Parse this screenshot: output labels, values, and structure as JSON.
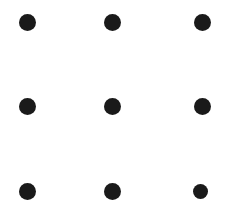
{
  "canvas": {
    "width": 240,
    "height": 213,
    "background_color": "#ffffff",
    "title": "Nine Dots Grid"
  },
  "dot_style": {
    "fill_color": "#1a1a1a",
    "shape": "circle"
  },
  "grid": {
    "rows": 3,
    "columns": 3,
    "count": 9,
    "column_centers_px": [
      27,
      112,
      202
    ],
    "row_centers_px": [
      22,
      106,
      191
    ]
  },
  "dots": [
    {
      "name": "dot-top-left",
      "row": 0,
      "col": 0,
      "cx": 27,
      "cy": 22,
      "d": 17
    },
    {
      "name": "dot-top-center",
      "row": 0,
      "col": 1,
      "cx": 112,
      "cy": 22,
      "d": 17
    },
    {
      "name": "dot-top-right",
      "row": 0,
      "col": 2,
      "cx": 202,
      "cy": 22,
      "d": 17
    },
    {
      "name": "dot-middle-left",
      "row": 1,
      "col": 0,
      "cx": 27,
      "cy": 106,
      "d": 17
    },
    {
      "name": "dot-middle-center",
      "row": 1,
      "col": 1,
      "cx": 112,
      "cy": 106,
      "d": 17
    },
    {
      "name": "dot-middle-right",
      "row": 1,
      "col": 2,
      "cx": 202,
      "cy": 106,
      "d": 17
    },
    {
      "name": "dot-bottom-left",
      "row": 2,
      "col": 0,
      "cx": 27,
      "cy": 191,
      "d": 17
    },
    {
      "name": "dot-bottom-center",
      "row": 2,
      "col": 1,
      "cx": 112,
      "cy": 191,
      "d": 17
    },
    {
      "name": "dot-bottom-right",
      "row": 2,
      "col": 2,
      "cx": 200,
      "cy": 191,
      "d": 15
    }
  ]
}
